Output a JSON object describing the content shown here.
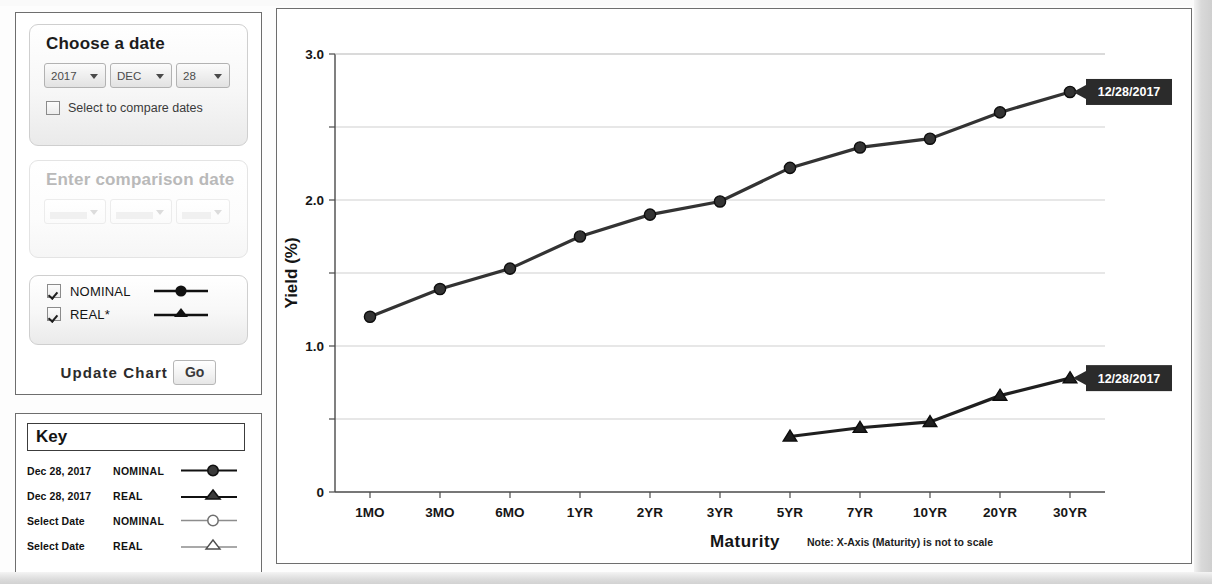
{
  "controls": {
    "choose_date": {
      "title": "Choose a date",
      "year": "2017",
      "month": "DEC",
      "day": "28",
      "compare_checkbox_label": "Select to compare dates",
      "compare_checked": false
    },
    "comparison_date": {
      "title": "Enter comparison date",
      "year": "",
      "month": "",
      "day": "",
      "disabled": true
    },
    "series_toggles": [
      {
        "label": "NOMINAL",
        "checked": true,
        "marker": "filled-circle"
      },
      {
        "label": "REAL*",
        "checked": true,
        "marker": "filled-triangle"
      }
    ],
    "update": {
      "text": "Update Chart",
      "button_label": "Go"
    }
  },
  "key": {
    "title": "Key",
    "rows": [
      {
        "date": "Dec 28, 2017",
        "series": "NOMINAL",
        "marker": "filled-circle"
      },
      {
        "date": "Dec 28, 2017",
        "series": "REAL",
        "marker": "filled-triangle"
      },
      {
        "date": "Select Date",
        "series": "NOMINAL",
        "marker": "open-circle"
      },
      {
        "date": "Select Date",
        "series": "REAL",
        "marker": "open-triangle"
      }
    ]
  },
  "chart_data": {
    "type": "line",
    "title": "",
    "xlabel": "Maturity",
    "ylabel": "Yield (%)",
    "xnote": "Note: X-Axis (Maturity) is not to scale",
    "categories": [
      "1MO",
      "3MO",
      "6MO",
      "1YR",
      "2YR",
      "3YR",
      "5YR",
      "7YR",
      "10YR",
      "20YR",
      "30YR"
    ],
    "ylim": [
      0,
      3.0
    ],
    "yticks": [
      0,
      0.5,
      1.0,
      1.5,
      2.0,
      2.5,
      3.0
    ],
    "ytick_labels": [
      "0",
      "",
      "1.0",
      "",
      "2.0",
      "",
      "3.0"
    ],
    "grid": true,
    "legend_position": "none",
    "series": [
      {
        "name": "NOMINAL",
        "marker": "filled-circle",
        "color": "#333333",
        "end_label": "12/28/2017",
        "values": [
          1.2,
          1.39,
          1.53,
          1.75,
          1.9,
          1.99,
          2.22,
          2.36,
          2.42,
          2.6,
          2.74
        ]
      },
      {
        "name": "REAL",
        "marker": "filled-triangle",
        "color": "#1f1f1f",
        "end_label": "12/28/2017",
        "values": [
          null,
          null,
          null,
          null,
          null,
          null,
          0.38,
          0.44,
          0.48,
          0.66,
          0.78
        ]
      }
    ],
    "annotations": [
      {
        "text": "12/28/2017",
        "series": "NOMINAL",
        "at_category": "30YR"
      },
      {
        "text": "12/28/2017",
        "series": "REAL",
        "at_category": "30YR"
      }
    ]
  },
  "colors": {
    "tooltip_bg": "#2b2b2b",
    "tooltip_fg": "#ffffff",
    "line": "#333333",
    "grid": "#c9c9c9",
    "axis": "#555555"
  }
}
